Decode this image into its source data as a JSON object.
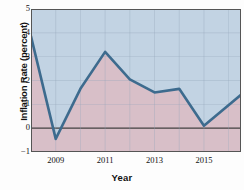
{
  "chart_data": {
    "type": "line",
    "title": "",
    "xlabel": "Year",
    "ylabel": "Inflation Rate (percent)",
    "xlim": [
      2008.0,
      2016.5
    ],
    "ylim": [
      -1,
      5
    ],
    "ytick_labels": [
      "5",
      "4",
      "3",
      "2",
      "1",
      "0",
      "−1"
    ],
    "ytick_values": [
      5,
      4,
      3,
      2,
      1,
      0,
      -1
    ],
    "xtick_labels": [
      "2009",
      "2011",
      "2013",
      "2015"
    ],
    "xtick_values": [
      2009,
      2011,
      2013,
      2015
    ],
    "grid": true,
    "legend": null,
    "zero_line": 0,
    "series": [
      {
        "name": "Inflation Rate",
        "x": [
          2008.0,
          2009.0,
          2010.0,
          2011.0,
          2012.0,
          2013.0,
          2014.0,
          2015.0,
          2016.5
        ],
        "values": [
          3.85,
          -0.45,
          1.65,
          3.2,
          2.05,
          1.5,
          1.65,
          0.1,
          1.4
        ]
      }
    ],
    "colors": {
      "line": "#3d6b8e",
      "fill_above": "#c2d3e3",
      "fill_below": "#d8bfc8",
      "grid": "#93a6bb",
      "axis": "#555555",
      "zero_line": "#3a3a3a"
    }
  }
}
